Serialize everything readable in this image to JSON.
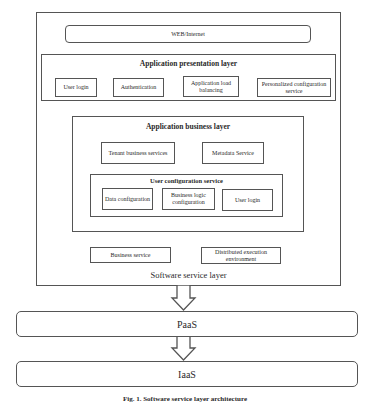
{
  "software_layer": {
    "label": "Software service layer",
    "web": "WEB/Internet",
    "presentation": {
      "title": "Application presentation layer",
      "items": [
        "User login",
        "Authentication",
        "Application load balancing",
        "Personalized configuration service"
      ]
    },
    "business": {
      "title": "Application business layer",
      "tenant": "Tenant business services",
      "metadata": "Metadata Service",
      "user_config": {
        "title": "User configuration service",
        "items": [
          "Data configuration",
          "Business logic configuration",
          "User login"
        ]
      }
    },
    "business_service": "Business service",
    "distributed": "Distributed execution environment"
  },
  "paas": "PaaS",
  "iaas": "IaaS",
  "caption": "Fig. 1. Software service layer architecture"
}
